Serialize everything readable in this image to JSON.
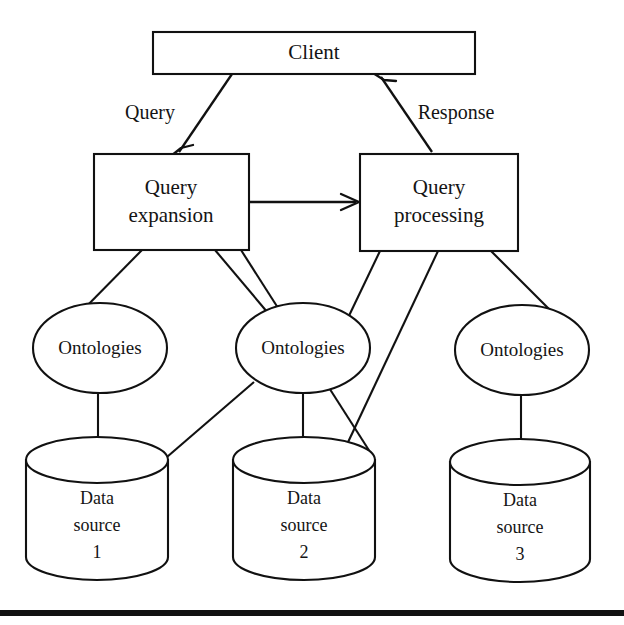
{
  "figure": {
    "kind": "architecture-diagram",
    "background_color": "#ffffff",
    "line_color": "#111111",
    "text_color": "#141414"
  },
  "nodes": {
    "client": {
      "label": "Client",
      "shape": "rectangle"
    },
    "query_expansion": {
      "line1": "Query",
      "line2": "expansion",
      "shape": "rectangle"
    },
    "query_processing": {
      "line1": "Query",
      "line2": "processing",
      "shape": "rectangle"
    },
    "ontology_1": {
      "label": "Ontologies",
      "shape": "ellipse"
    },
    "ontology_2": {
      "label": "Ontologies",
      "shape": "ellipse"
    },
    "ontology_3": {
      "label": "Ontologies",
      "shape": "ellipse"
    },
    "data_source_1": {
      "line1": "Data",
      "line2": "source",
      "line3": "1",
      "shape": "cylinder"
    },
    "data_source_2": {
      "line1": "Data",
      "line2": "source",
      "line3": "2",
      "shape": "cylinder"
    },
    "data_source_3": {
      "line1": "Data",
      "line2": "source",
      "line3": "3",
      "shape": "cylinder"
    }
  },
  "edges": {
    "query": {
      "label": "Query",
      "from": "client",
      "to": "query_expansion",
      "arrow": true
    },
    "response": {
      "label": "Response",
      "from": "query_processing",
      "to": "client",
      "arrow": true
    },
    "expansion_to_processing": {
      "label": "",
      "from": "query_expansion",
      "to": "query_processing",
      "arrow": true
    },
    "plain": [
      {
        "from": "query_expansion",
        "to": "ontology_1"
      },
      {
        "from": "query_expansion",
        "to": "ontology_2"
      },
      {
        "from": "query_expansion",
        "to": "data_source_2"
      },
      {
        "from": "query_processing",
        "to": "ontology_2"
      },
      {
        "from": "query_processing",
        "to": "ontology_3"
      },
      {
        "from": "query_processing",
        "to": "data_source_2"
      },
      {
        "from": "ontology_1",
        "to": "data_source_1"
      },
      {
        "from": "ontology_2",
        "to": "data_source_1"
      },
      {
        "from": "ontology_2",
        "to": "data_source_2"
      },
      {
        "from": "ontology_3",
        "to": "data_source_3"
      }
    ]
  }
}
